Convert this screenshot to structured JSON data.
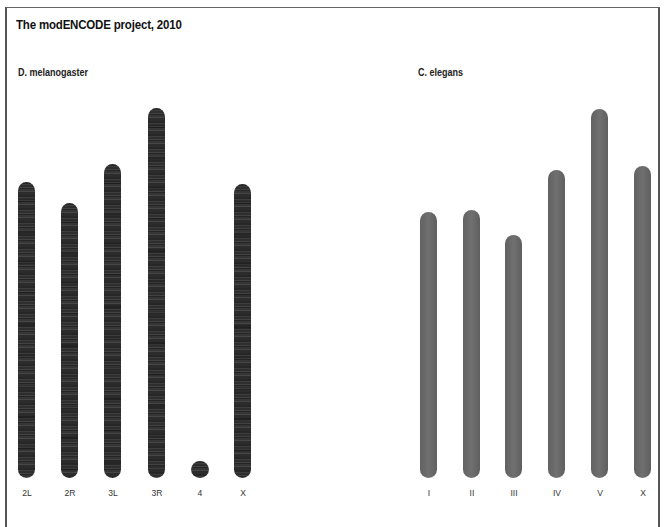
{
  "title": "The modENCODE project, 2010",
  "panels": [
    {
      "name": "D. melanogaster",
      "chromosomes": [
        {
          "label": "2L",
          "x": 18,
          "top": 182,
          "bottom": 478
        },
        {
          "label": "2R",
          "x": 61,
          "top": 203,
          "bottom": 478
        },
        {
          "label": "3L",
          "x": 104,
          "top": 164,
          "bottom": 478
        },
        {
          "label": "3R",
          "x": 148,
          "top": 108,
          "bottom": 478
        },
        {
          "label": "4",
          "x": 191,
          "top": 461,
          "bottom": 478
        },
        {
          "label": "X",
          "x": 234,
          "top": 184,
          "bottom": 478
        }
      ]
    },
    {
      "name": "C. elegans",
      "chromosomes": [
        {
          "label": "I",
          "x": 420,
          "top": 212,
          "bottom": 478
        },
        {
          "label": "II",
          "x": 463,
          "top": 210,
          "bottom": 478
        },
        {
          "label": "III",
          "x": 505,
          "top": 235,
          "bottom": 478
        },
        {
          "label": "IV",
          "x": 548,
          "top": 170,
          "bottom": 478
        },
        {
          "label": "V",
          "x": 591,
          "top": 109,
          "bottom": 478
        },
        {
          "label": "X",
          "x": 634,
          "top": 166,
          "bottom": 478
        }
      ]
    }
  ],
  "colors": {
    "chromosome_fill": "#6a6a6a",
    "band_dark": "#555555",
    "band_light": "#a2a2a2"
  }
}
